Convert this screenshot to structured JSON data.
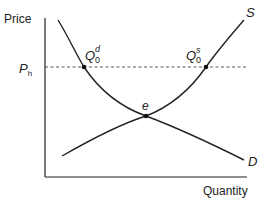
{
  "diagram": {
    "type": "supply-demand",
    "axes": {
      "y_label": "Price",
      "x_label": "Quantity"
    },
    "price_line": {
      "label_main": "P",
      "label_sub": "h",
      "style": "dashed"
    },
    "curves": {
      "supply": {
        "label": "S"
      },
      "demand": {
        "label": "D"
      }
    },
    "points": {
      "equilibrium": {
        "label": "e"
      },
      "quantity_demanded": {
        "symbol": "Q",
        "sup": "d",
        "sub": "0"
      },
      "quantity_supplied": {
        "symbol": "Q",
        "sup": "s",
        "sub": "0"
      }
    },
    "colors": {
      "line": "#222222",
      "background": "#ffffff"
    }
  }
}
